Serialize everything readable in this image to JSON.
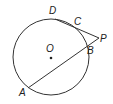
{
  "diagram": {
    "type": "circle-secants",
    "circle": {
      "center_label": "O",
      "cx": 51,
      "cy": 57,
      "r": 38
    },
    "points": {
      "D": {
        "label": "D",
        "x": 55,
        "y": 19
      },
      "C": {
        "label": "C",
        "x": 77,
        "y": 28
      },
      "P": {
        "label": "P",
        "x": 99,
        "y": 38
      },
      "B": {
        "label": "B",
        "x": 88,
        "y": 47
      },
      "A": {
        "label": "A",
        "x": 28,
        "y": 88
      }
    },
    "segments": [
      [
        "P",
        "D"
      ],
      [
        "P",
        "A"
      ]
    ],
    "colors": {
      "stroke": "#333333",
      "text": "#222222"
    }
  }
}
